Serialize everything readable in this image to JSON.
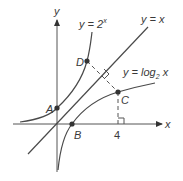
{
  "diagram": {
    "axes": {
      "x_label": "x",
      "y_label": "y"
    },
    "curves": {
      "exp": {
        "label_prefix": "y = 2",
        "label_exp": "x"
      },
      "identity": {
        "label": "y = x"
      },
      "log": {
        "label_prefix": "y = log",
        "label_sub": "2",
        "label_suffix": " x"
      }
    },
    "points": {
      "A": "A",
      "B": "B",
      "C": "C",
      "D": "D"
    },
    "tick_4": "4",
    "colors": {
      "line": "#4a4a4a",
      "point": "#333333",
      "background": "#ffffff"
    }
  }
}
